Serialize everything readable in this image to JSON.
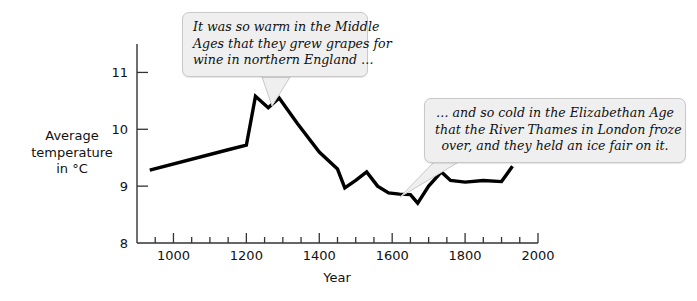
{
  "chart_data": {
    "type": "line",
    "title": "",
    "xlabel": "Year",
    "ylabel": "Average temperature in °C",
    "xlim": [
      900,
      2000
    ],
    "ylim": [
      8,
      11.5
    ],
    "grid": false,
    "legend": "none",
    "x_ticks": [
      1000,
      1200,
      1400,
      1600,
      1800,
      2000
    ],
    "x_minor_tick_step": 50,
    "y_ticks": [
      8,
      9,
      10,
      11
    ],
    "series": [
      {
        "name": "Average temperature",
        "color": "#000000",
        "x": [
          935,
          1150,
          1200,
          1225,
          1260,
          1290,
          1340,
          1400,
          1450,
          1470,
          1500,
          1530,
          1560,
          1590,
          1620,
          1650,
          1670,
          1700,
          1735,
          1760,
          1800,
          1850,
          1900,
          1930
        ],
        "values": [
          9.28,
          9.64,
          9.72,
          10.58,
          10.38,
          10.55,
          10.1,
          9.6,
          9.3,
          8.97,
          9.1,
          9.25,
          9.0,
          8.88,
          8.86,
          8.85,
          8.7,
          9.0,
          9.25,
          9.1,
          9.07,
          9.1,
          9.08,
          9.35
        ]
      }
    ]
  },
  "axis": {
    "y_label_lines": [
      "Average",
      "temperature",
      "in °C"
    ],
    "x_label": "Year",
    "y_tick_labels": [
      "11",
      "10",
      "9",
      "8"
    ],
    "x_tick_labels": [
      "1000",
      "1200",
      "1400",
      "1600",
      "1800",
      "2000"
    ]
  },
  "callouts": [
    {
      "id": "callout-1",
      "lines": [
        "It was so warm in the Middle",
        "Ages that they grew grapes for",
        "wine in northern England …"
      ],
      "background": "#efefef",
      "border": "#c8c8c8"
    },
    {
      "id": "callout-2",
      "lines": [
        "… and so cold in the Elizabethan Age",
        "that the River Thames in London froze",
        "over, and they held an ice fair on it."
      ],
      "background": "#efefef",
      "border": "#c8c8c8"
    }
  ],
  "colors": {
    "line": "#000000",
    "axis": "#333333",
    "background": "#ffffff",
    "callout_fill": "#efefef",
    "callout_border": "#c8c8c8"
  }
}
